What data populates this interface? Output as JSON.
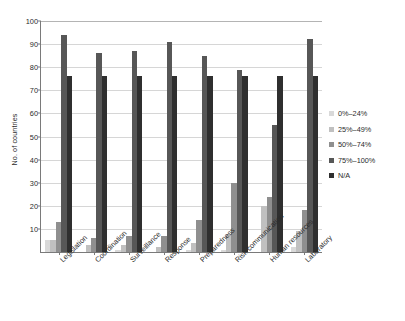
{
  "chart_data": {
    "type": "bar",
    "title": "",
    "xlabel": "",
    "ylabel": "No. of countries",
    "ylim": [
      0,
      100
    ],
    "ytick_step": 10,
    "yticks": [
      0,
      10,
      20,
      30,
      40,
      50,
      60,
      70,
      80,
      90,
      100
    ],
    "grid": true,
    "legend_position": "right",
    "categories": [
      "Legislation",
      "Coordination",
      "Surveillance",
      "Response",
      "Preparedness",
      "Risk communication",
      "Human resources",
      "Laboratory"
    ],
    "series": [
      {
        "name": "0%–24%",
        "color": "#d9d9d9",
        "values": [
          5,
          0,
          1,
          0,
          1,
          1,
          0,
          2
        ]
      },
      {
        "name": "25%–49%",
        "color": "#c0c0c0",
        "values": [
          5,
          3,
          3,
          2,
          4,
          8,
          20,
          9
        ]
      },
      {
        "name": "50%–74%",
        "color": "#8f8f8f",
        "values": [
          13,
          6,
          7,
          7,
          14,
          30,
          24,
          18
        ]
      },
      {
        "name": "75%–100%",
        "color": "#575757",
        "values": [
          94,
          86,
          87,
          91,
          85,
          79,
          55,
          92
        ]
      },
      {
        "name": "N/A",
        "color": "#2f2f2f",
        "values": [
          76,
          76,
          76,
          76,
          76,
          76,
          76,
          76
        ]
      }
    ]
  },
  "caption": {
    "text": ""
  }
}
